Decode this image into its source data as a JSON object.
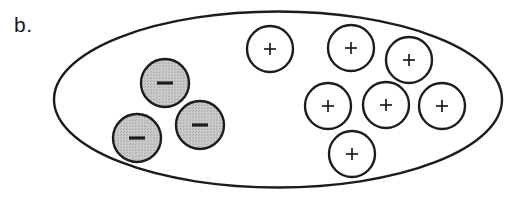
{
  "figure": {
    "panel_label": "b.",
    "label_position": {
      "x": 14,
      "y": 32
    },
    "canvas": {
      "width": 523,
      "height": 199
    },
    "background_color": "#ffffff",
    "outline_color": "#1c1c1c"
  },
  "membrane": {
    "name": "cell-membrane-ellipse",
    "shape": "ellipse",
    "cx": 278,
    "cy": 99.5,
    "rx": 224,
    "ry": 88,
    "fill": "#ffffff",
    "stroke": "#1c1c1c",
    "stroke_width": 2.4
  },
  "ions": {
    "negative": {
      "symbol": "−",
      "fill": "#c6c6c6",
      "stroke": "#1c1c1c",
      "count": 3,
      "radius": 24,
      "items": [
        {
          "id": "negative-ion-1",
          "cx": 165,
          "cy": 83
        },
        {
          "id": "negative-ion-2",
          "cx": 137,
          "cy": 138
        },
        {
          "id": "negative-ion-3",
          "cx": 200,
          "cy": 125
        }
      ]
    },
    "positive": {
      "symbol": "+",
      "fill": "#ffffff",
      "stroke": "#1c1c1c",
      "count": 7,
      "radius": 23,
      "items": [
        {
          "id": "positive-ion-1",
          "cx": 270,
          "cy": 49
        },
        {
          "id": "positive-ion-2",
          "cx": 351,
          "cy": 48
        },
        {
          "id": "positive-ion-3",
          "cx": 409,
          "cy": 60
        },
        {
          "id": "positive-ion-4",
          "cx": 328,
          "cy": 106
        },
        {
          "id": "positive-ion-5",
          "cx": 386,
          "cy": 105
        },
        {
          "id": "positive-ion-6",
          "cx": 442,
          "cy": 106
        },
        {
          "id": "positive-ion-7",
          "cx": 352,
          "cy": 154
        }
      ]
    }
  }
}
